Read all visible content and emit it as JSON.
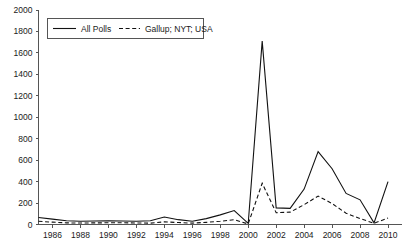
{
  "chart_data": {
    "type": "line",
    "title": "",
    "subtitle": "",
    "xlabel": "",
    "ylabel": "",
    "xlim": [
      1985,
      2011
    ],
    "ylim": [
      0,
      2000
    ],
    "grid": false,
    "legend_position": "top-left",
    "y_ticks": [
      0,
      200,
      400,
      600,
      800,
      1000,
      1200,
      1400,
      1600,
      1800,
      2000
    ],
    "y_tick_labels": [
      "0",
      "200",
      "400",
      "600",
      "800",
      "1000",
      "1200",
      "1400",
      "1600",
      "1800",
      "2000"
    ],
    "x_ticks": [
      1986,
      1988,
      1990,
      1992,
      1994,
      1996,
      1998,
      2000,
      2002,
      2004,
      2006,
      2008,
      2010
    ],
    "x_tick_labels": [
      "1986",
      "1988",
      "1990",
      "1992",
      "1994",
      "1996",
      "1998",
      "2000",
      "2002",
      "2004",
      "2006",
      "2008",
      "2010"
    ],
    "x": [
      1985,
      1986,
      1987,
      1988,
      1989,
      1990,
      1991,
      1992,
      1993,
      1994,
      1995,
      1996,
      1997,
      1998,
      1999,
      2000,
      2001,
      2002,
      2003,
      2004,
      2005,
      2006,
      2007,
      2008,
      2009,
      2010
    ],
    "series": [
      {
        "name": "All Polls",
        "style": "solid",
        "color": "#111111",
        "values": [
          65,
          50,
          35,
          30,
          32,
          35,
          33,
          30,
          35,
          70,
          45,
          30,
          55,
          90,
          130,
          10,
          1710,
          155,
          150,
          330,
          680,
          520,
          290,
          230,
          15,
          400
        ]
      },
      {
        "name": "Gallup; NYT; USA",
        "style": "dashed",
        "color": "#111111",
        "values": [
          30,
          22,
          15,
          14,
          15,
          16,
          16,
          14,
          13,
          25,
          18,
          13,
          20,
          30,
          45,
          5,
          385,
          110,
          115,
          185,
          265,
          195,
          105,
          55,
          12,
          60
        ]
      }
    ]
  },
  "legend": {
    "entries": [
      {
        "label": "All Polls",
        "style": "solid"
      },
      {
        "label": "Gallup; NYT; USA",
        "style": "dashed"
      }
    ]
  },
  "axis": {
    "y_labels": [
      "2000",
      "1800",
      "1600",
      "1400",
      "1200",
      "1000",
      "800",
      "600",
      "400",
      "200",
      "0"
    ],
    "x_labels": [
      "1986",
      "1988",
      "1990",
      "1992",
      "1994",
      "1996",
      "1998",
      "2000",
      "2002",
      "2004",
      "2006",
      "2008",
      "2010"
    ]
  }
}
